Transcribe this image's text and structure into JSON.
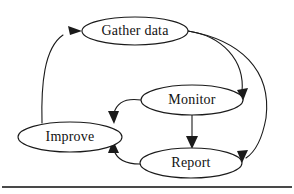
{
  "diagram": {
    "background_color": "#ffffff",
    "line_color": "#1a1a1a",
    "text_color": "#121212",
    "nodes": [
      {
        "id": "gather-data",
        "label": "Gather data",
        "cx": 135,
        "cy": 31,
        "rx": 53,
        "ry": 14
      },
      {
        "id": "monitor",
        "label": "Monitor",
        "cx": 192,
        "cy": 100,
        "rx": 51,
        "ry": 15
      },
      {
        "id": "improve",
        "label": "Improve",
        "cx": 70,
        "cy": 137,
        "rx": 52,
        "ry": 15
      },
      {
        "id": "report",
        "label": "Report",
        "cx": 191,
        "cy": 163,
        "rx": 51,
        "ry": 15
      }
    ],
    "edges": [
      {
        "id": "improve-to-gather-data",
        "from": "improve",
        "to": "gather-data",
        "style": "curved",
        "path": "M 42 123 C 41 85 44 48 63 35",
        "arrow": "M 82 31 L 68 26 L 70 35 Z"
      },
      {
        "id": "gather-data-to-monitor",
        "from": "gather-data",
        "to": "monitor",
        "style": "curved",
        "path": "M 188 31 C 222 36 245 60 242 92",
        "arrow": "M 243 101 L 248 88 L 237 90 Z"
      },
      {
        "id": "gather-data-to-report",
        "from": "gather-data",
        "to": "report",
        "style": "curved",
        "path": "M 188 31 C 240 40 272 70 266 118 C 262 140 255 152 246 158",
        "arrow": "M 242 163 L 248 150 L 237 151 Z"
      },
      {
        "id": "monitor-to-improve",
        "from": "monitor",
        "to": "improve",
        "style": "curved",
        "path": "M 141 100 C 127 98 117 102 114 113",
        "arrow": "M 114 124 L 119 111 L 108 111 Z"
      },
      {
        "id": "monitor-to-report",
        "from": "monitor",
        "to": "report",
        "style": "straight",
        "path": "M 192 115 L 192 139",
        "arrow": "M 192 149 L 198 136 L 186 136 Z"
      },
      {
        "id": "report-to-improve",
        "from": "report",
        "to": "improve",
        "style": "curved",
        "path": "M 140 164 C 126 164 117 160 114 150",
        "arrow": "M 113 140 L 108 153 L 119 153 Z"
      }
    ],
    "footer_rule": {
      "id": "bottom-divider",
      "x1": 2,
      "y1": 187,
      "x2": 292,
      "y2": 187
    }
  }
}
